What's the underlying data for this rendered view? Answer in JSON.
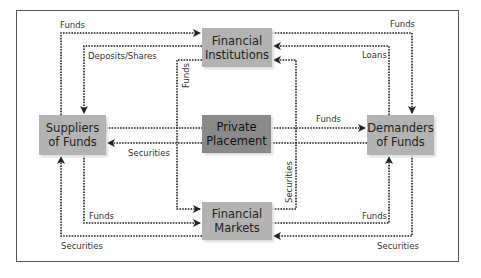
{
  "nodes": {
    "financial_institutions": "Financial\nInstitutions",
    "private_placement": "Private\nPlacement",
    "financial_markets": "Financial\nMarkets",
    "suppliers": "Suppliers\nof Funds",
    "demanders": "Demanders\nof Funds"
  },
  "labels": {
    "funds_top_left": "Funds",
    "deposits_shares": "Deposits/Shares",
    "funds_top_right": "Funds",
    "loans": "Loans",
    "funds_vertical": "Funds",
    "funds_middle": "Funds",
    "securities_middle": "Securities",
    "securities_vertical": "Securities",
    "funds_bottom_left": "Funds",
    "funds_bottom_right": "Funds",
    "securities_bottom_left": "Securities",
    "securities_bottom_right": "Securities"
  },
  "colors": {
    "box_light": "#b3b3b3",
    "box_dark": "#8a8a8a",
    "line": "#222222"
  }
}
